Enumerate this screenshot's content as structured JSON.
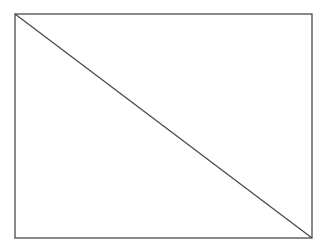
{
  "diagram": {
    "canvas": {
      "width": 327,
      "height": 250,
      "background": "#ffffff"
    },
    "rectangle": {
      "x": 15,
      "y": 14,
      "width": 297,
      "height": 224,
      "stroke": "#4a4a4a",
      "stroke_width": 1.3,
      "fill": "none"
    },
    "diagonal": {
      "x1": 15,
      "y1": 14,
      "x2": 312,
      "y2": 238,
      "stroke": "#4a4a4a",
      "stroke_width": 1.3
    }
  }
}
